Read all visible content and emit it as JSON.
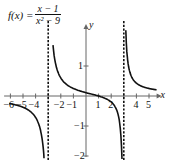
{
  "chart_data": {
    "type": "line",
    "title_parts": {
      "lhs": "f(x) =",
      "numerator": "x − 1",
      "denominator": "x² − 9"
    },
    "xlabel": "x",
    "ylabel": "y",
    "xlim": [
      -6.5,
      6
    ],
    "ylim": [
      -2,
      2.3
    ],
    "x_ticks": [
      -6,
      -5,
      -4,
      -3,
      -2,
      -1,
      1,
      2,
      3,
      4,
      5
    ],
    "x_tick_labels": [
      "-6",
      "-5",
      "-4",
      "-2",
      "-1",
      "1",
      "2",
      "4",
      "5"
    ],
    "y_ticks": [
      1,
      -1,
      -2
    ],
    "y_tick_labels": [
      "1",
      "-1",
      "-2"
    ],
    "vertical_asymptotes": [
      -3,
      3
    ],
    "horizontal_asymptote": 0,
    "grid": false,
    "legend": "none",
    "series": [
      {
        "name": "f(x) left branch",
        "x": [
          -6,
          -5.5,
          -5,
          -4.5,
          -4,
          -3.7,
          -3.5,
          -3.35
        ],
        "y": [
          -0.259,
          -0.305,
          -0.375,
          -0.489,
          -0.714,
          -0.974,
          -1.263,
          -1.834
        ]
      },
      {
        "name": "f(x) middle branch",
        "x": [
          -2.6,
          -2.5,
          -2,
          -1.5,
          -1,
          -0.5,
          0,
          0.5,
          1,
          1.5,
          2,
          2.5,
          2.65
        ],
        "y": [
          2.14,
          1.27,
          0.6,
          0.37,
          0.25,
          0.171,
          0.111,
          0.057,
          0,
          -0.074,
          -0.2,
          -0.545,
          -0.93
        ]
      },
      {
        "name": "f(x) middle tail",
        "x": [
          2.65,
          2.75,
          2.85,
          2.92
        ],
        "y": [
          -0.93,
          -1.21,
          -2.1,
          -2.3
        ]
      },
      {
        "name": "f(x) right branch",
        "x": [
          3.25,
          3.4,
          3.5,
          4,
          4.5,
          5,
          5.5
        ],
        "y": [
          2.33,
          1.83,
          1.91,
          0.429,
          0.311,
          0.25,
          0.212
        ]
      }
    ]
  }
}
